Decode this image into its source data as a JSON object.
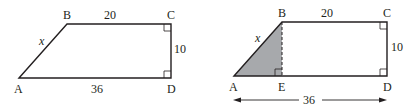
{
  "figures": [
    {
      "name": "trapezoid",
      "vertices": {
        "A": "A",
        "B": "B",
        "C": "C",
        "D": "D"
      },
      "labels": {
        "top": "20",
        "right": "10",
        "bottom": "36",
        "slant": "x"
      }
    },
    {
      "name": "trapezoid-split",
      "vertices": {
        "A": "A",
        "B": "B",
        "C": "C",
        "D": "D",
        "E": "E"
      },
      "labels": {
        "top": "20",
        "right": "10",
        "bottom": "36",
        "slant": "x"
      },
      "shaded_color": "#a7a9ac"
    }
  ],
  "colors": {
    "stroke": "#231f20",
    "shade": "#a7a9ac"
  }
}
